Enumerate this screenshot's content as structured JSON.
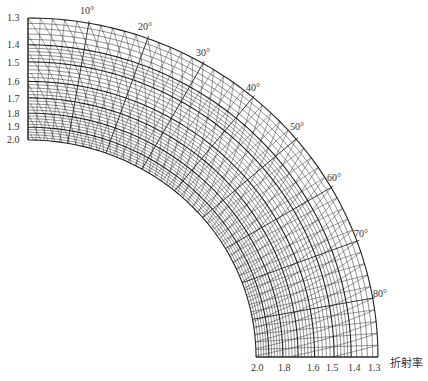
{
  "diagram": {
    "type": "polar-nomogram",
    "angle_labels": [
      "10°",
      "20°",
      "30°",
      "40°",
      "50°",
      "60°",
      "70°",
      "80°"
    ],
    "angle_values": [
      10,
      20,
      30,
      40,
      50,
      60,
      70,
      80
    ],
    "left_index_labels": [
      "1.3",
      "1.4",
      "1.5",
      "1.6",
      "1.7",
      "1.8",
      "1.9",
      "2.0"
    ],
    "bottom_index_labels": [
      "2.0",
      "1.8",
      "1.6",
      "1.5",
      "1.4",
      "1.3"
    ],
    "axis_title": "折射率",
    "line_color": "#222222",
    "background": "#ffffff"
  }
}
